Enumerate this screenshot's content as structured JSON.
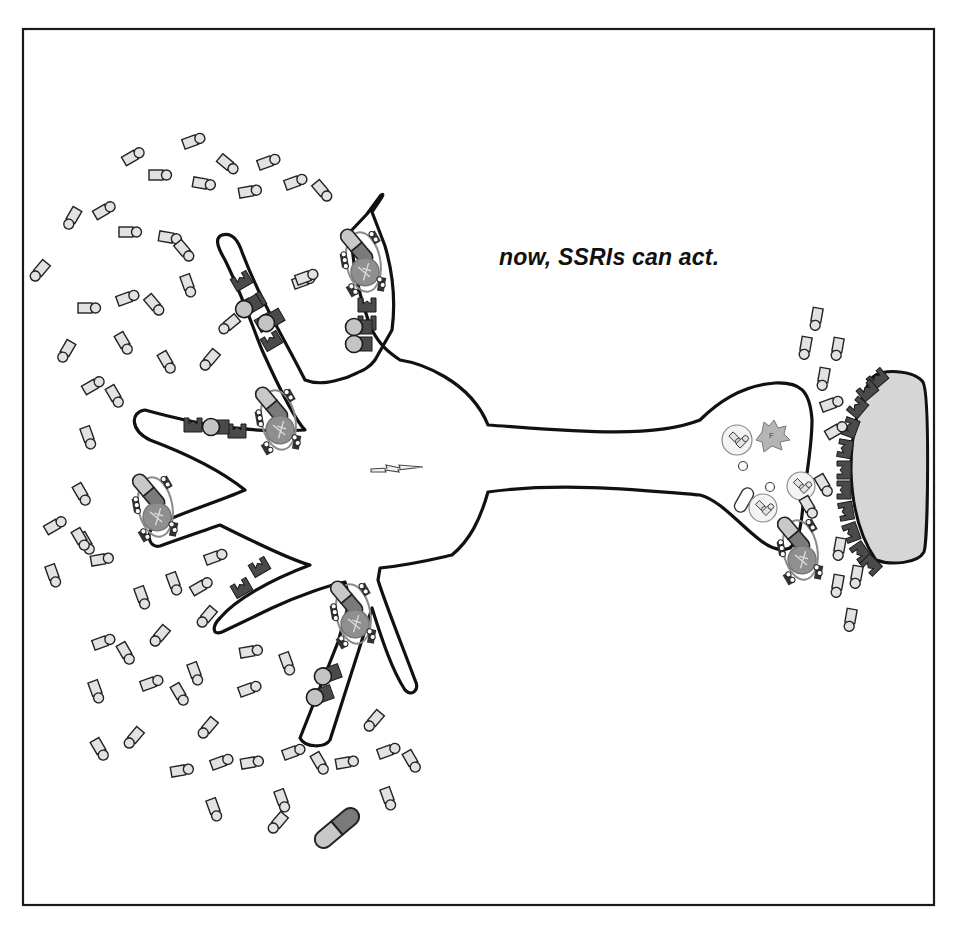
{
  "caption": "now, SSRIs can act.",
  "colors": {
    "outline": "#111111",
    "cell_fill": "#ffffff",
    "postsynaptic_fill": "#d6d6d6",
    "receptor_fill": "#4a4a4a",
    "molecule_fill": "#e2e2e2",
    "pill_light": "#c8c8c8",
    "pill_dark": "#7a7a7a",
    "transporter_fill": "#8a8a8a",
    "enzyme_fill": "#b5b5b5"
  },
  "frame": {
    "x": 23,
    "y": 29,
    "w": 911,
    "h": 876
  },
  "cell_body": {
    "cx": 405,
    "cy": 465,
    "label": "neuron soma"
  },
  "icons": {
    "action_potential": "lightning-bolt-icon",
    "ssri_pill": "capsule-icon",
    "transporter": "serotonin-transporter-icon",
    "enzyme": "enzyme-icon"
  },
  "molecules": [
    [
      190,
      142,
      -20
    ],
    [
      130,
      158,
      -30
    ],
    [
      156,
      175,
      0
    ],
    [
      225,
      162,
      40
    ],
    [
      265,
      163,
      -20
    ],
    [
      200,
      183,
      10
    ],
    [
      246,
      192,
      -10
    ],
    [
      292,
      183,
      -20
    ],
    [
      320,
      188,
      50
    ],
    [
      74,
      215,
      120
    ],
    [
      101,
      212,
      -30
    ],
    [
      126,
      232,
      0
    ],
    [
      166,
      237,
      10
    ],
    [
      182,
      248,
      50
    ],
    [
      42,
      268,
      130
    ],
    [
      85,
      308,
      0
    ],
    [
      124,
      299,
      -20
    ],
    [
      152,
      302,
      50
    ],
    [
      187,
      282,
      70
    ],
    [
      232,
      322,
      140
    ],
    [
      300,
      282,
      -20
    ],
    [
      68,
      348,
      120
    ],
    [
      122,
      340,
      60
    ],
    [
      165,
      359,
      60
    ],
    [
      212,
      357,
      130
    ],
    [
      90,
      387,
      -30
    ],
    [
      113,
      393,
      60
    ],
    [
      87,
      434,
      70
    ],
    [
      80,
      491,
      60
    ],
    [
      84,
      540,
      60
    ],
    [
      52,
      527,
      -30
    ],
    [
      79,
      536,
      60
    ],
    [
      52,
      572,
      70
    ],
    [
      98,
      560,
      -10
    ],
    [
      212,
      558,
      -20
    ],
    [
      141,
      594,
      70
    ],
    [
      173,
      580,
      70
    ],
    [
      198,
      588,
      -30
    ],
    [
      209,
      614,
      130
    ],
    [
      100,
      643,
      -20
    ],
    [
      124,
      650,
      60
    ],
    [
      162,
      633,
      130
    ],
    [
      95,
      688,
      70
    ],
    [
      148,
      684,
      -20
    ],
    [
      178,
      691,
      60
    ],
    [
      194,
      670,
      70
    ],
    [
      247,
      652,
      -10
    ],
    [
      246,
      690,
      -20
    ],
    [
      286,
      660,
      70
    ],
    [
      210,
      725,
      130
    ],
    [
      136,
      735,
      130
    ],
    [
      98,
      746,
      60
    ],
    [
      178,
      771,
      -10
    ],
    [
      218,
      763,
      -20
    ],
    [
      248,
      763,
      -10
    ],
    [
      290,
      753,
      -20
    ],
    [
      318,
      760,
      60
    ],
    [
      343,
      763,
      -10
    ],
    [
      385,
      752,
      -20
    ],
    [
      410,
      758,
      60
    ],
    [
      213,
      806,
      70
    ],
    [
      281,
      797,
      70
    ],
    [
      280,
      820,
      130
    ],
    [
      387,
      795,
      70
    ],
    [
      376,
      718,
      130
    ],
    [
      303,
      278,
      -20
    ],
    [
      817,
      315,
      100
    ],
    [
      806,
      344,
      100
    ],
    [
      838,
      345,
      100
    ],
    [
      824,
      375,
      100
    ],
    [
      828,
      405,
      -20
    ],
    [
      833,
      432,
      -30
    ],
    [
      822,
      482,
      60
    ],
    [
      840,
      545,
      100
    ],
    [
      838,
      582,
      100
    ],
    [
      857,
      573,
      100
    ],
    [
      851,
      616,
      100
    ],
    [
      807,
      504,
      60
    ]
  ],
  "ssri_pills": [
    {
      "x": 337,
      "y": 828,
      "angle": 50,
      "scale": 1.25,
      "free": true
    }
  ],
  "transporter_units": [
    {
      "x": 363,
      "y": 260,
      "angle": -10
    },
    {
      "x": 278,
      "y": 418,
      "angle": -10
    },
    {
      "x": 155,
      "y": 505,
      "angle": -10
    },
    {
      "x": 353,
      "y": 612,
      "angle": -10
    },
    {
      "x": 800,
      "y": 548,
      "angle": -10
    }
  ],
  "receptors": {
    "dendrite_top_left": [
      [
        245,
        287,
        -30
      ],
      [
        259,
        308,
        -30
      ],
      [
        269,
        328,
        -30
      ],
      [
        275,
        347,
        -30
      ]
    ],
    "dendrite_left": [
      [
        193,
        432,
        0
      ],
      [
        237,
        438,
        0
      ]
    ],
    "dendrite_lower_left": [
      [
        245,
        594,
        -30
      ],
      [
        263,
        573,
        -30
      ]
    ],
    "dendrite_top": [
      [
        367,
        312,
        0
      ],
      [
        367,
        330,
        0
      ]
    ],
    "postsynaptic": [
      [
        882,
        384,
        -40
      ],
      [
        872,
        396,
        -40
      ],
      [
        863,
        412,
        -50
      ],
      [
        857,
        430,
        -70
      ],
      [
        852,
        450,
        -80
      ],
      [
        851,
        470,
        -90
      ],
      [
        851,
        490,
        -90
      ],
      [
        853,
        510,
        -100
      ],
      [
        858,
        530,
        -110
      ],
      [
        866,
        548,
        -125
      ],
      [
        876,
        560,
        -135
      ]
    ]
  },
  "occupied_receptors": [
    [
      248,
      308,
      -30
    ],
    [
      270,
      322,
      -30
    ],
    [
      358,
      328,
      0
    ],
    [
      358,
      345,
      0
    ],
    [
      215,
      428,
      0
    ],
    [
      327,
      676,
      -20
    ],
    [
      319,
      697,
      -20
    ]
  ],
  "vesicles": [
    {
      "x": 737,
      "y": 440,
      "r": 15
    },
    {
      "x": 801,
      "y": 486,
      "r": 14
    },
    {
      "x": 763,
      "y": 508,
      "r": 14
    }
  ],
  "small_vesicles": [
    {
      "x": 743,
      "y": 466,
      "r": 4.5
    },
    {
      "x": 770,
      "y": 487,
      "r": 4.5
    }
  ]
}
